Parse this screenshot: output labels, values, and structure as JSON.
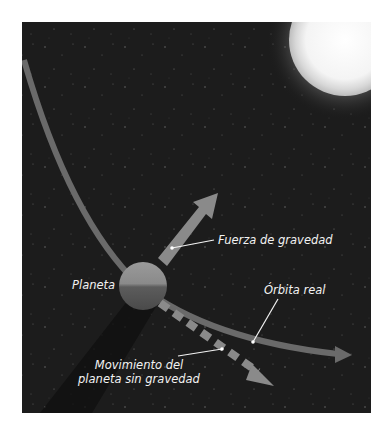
{
  "figure": {
    "title": "",
    "elements": {
      "sun": {
        "name": "Sol",
        "color": "#ffffff"
      },
      "planet": {
        "label": "Planeta"
      },
      "gravity_arrow": {
        "label": "Fuerza de gravedad",
        "color": "#8a8a8a"
      },
      "orbit": {
        "label": "Órbita real",
        "color": "#6a6a6a"
      },
      "inertial_path": {
        "label_line1": "Movimiento del",
        "label_line2": "planeta sin gravedad",
        "color": "#8a8a8a"
      }
    },
    "colors": {
      "background": "#1c1c1c",
      "page": "#ffffff",
      "text": "#f2f2f2"
    }
  }
}
